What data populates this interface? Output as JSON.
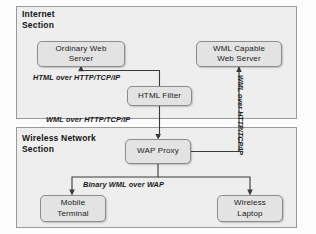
{
  "diagram": {
    "panels": [
      {
        "id": "internet",
        "label": "Internet\nSection"
      },
      {
        "id": "wireless",
        "label": "Wireless Network\nSection"
      }
    ],
    "nodes": [
      {
        "id": "ordinary-web-server",
        "label": "Ordinary Web\nServer"
      },
      {
        "id": "wml-capable-web-server",
        "label": "WML Capable\nWeb Server"
      },
      {
        "id": "html-filter",
        "label": "HTML Filter"
      },
      {
        "id": "wap-proxy",
        "label": "WAP Proxy"
      },
      {
        "id": "mobile-terminal",
        "label": "Mobile\nTerminal"
      },
      {
        "id": "wireless-laptop",
        "label": "Wireless\nLaptop"
      }
    ],
    "edge_labels": [
      {
        "id": "html-over-http",
        "label": "HTML over HTTP/TCP/IP"
      },
      {
        "id": "wml-over-http",
        "label": "WML over HTTP/TCP/IP"
      },
      {
        "id": "wml-over-http-vertical",
        "label": "WML over HTTP/TCP/IP"
      },
      {
        "id": "binary-wml-over-wap",
        "label": "Binary WML over WAP"
      }
    ],
    "colors": {
      "panel_fill": "#eeeeee",
      "panel_border": "#9a9a9a",
      "node_fill": "#e3e3e3",
      "node_border": "#8c8c8c",
      "wire": "#3a3a3a",
      "text": "#1a1a1a"
    }
  }
}
